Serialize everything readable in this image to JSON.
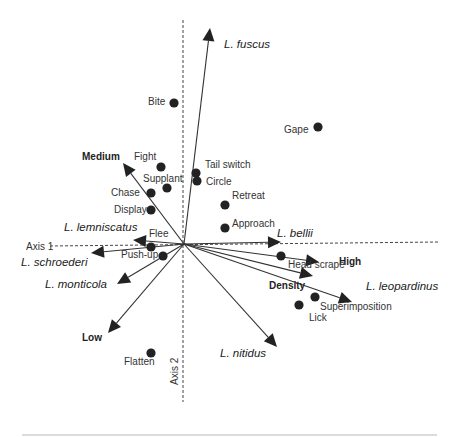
{
  "figure": {
    "type": "biplot",
    "origin": [
      184,
      244
    ],
    "axes": {
      "axis1": {
        "label": "Axis 1",
        "x1": 50,
        "y1": 246,
        "x2": 440,
        "y2": 242,
        "label_pos": [
          26,
          250
        ]
      },
      "axis2": {
        "label": "Axis 2",
        "x1": 183,
        "y1": 20,
        "x2": 183,
        "y2": 402,
        "label_pos": [
          178,
          385
        ]
      }
    },
    "species_vectors": [
      {
        "label": "L. fuscus",
        "tip": [
          210,
          28
        ],
        "label_pos": [
          224,
          48
        ]
      },
      {
        "label": "L. bellii",
        "tip": [
          281,
          242
        ],
        "label_pos": [
          277,
          237
        ]
      },
      {
        "label": "L. leopardinus",
        "tip": [
          352,
          302
        ],
        "label_pos": [
          366,
          290
        ]
      },
      {
        "label": "L. lemniscatus",
        "tip": [
          133,
          240
        ],
        "label_pos": [
          64,
          231
        ]
      },
      {
        "label": "L. schroederi",
        "tip": [
          91,
          253
        ],
        "label_pos": [
          21,
          266
        ]
      },
      {
        "label": "L. monticola",
        "tip": [
          117,
          284
        ],
        "label_pos": [
          45,
          288
        ]
      },
      {
        "label": "L. nitidus",
        "tip": [
          277,
          347
        ],
        "label_pos": [
          220,
          357
        ]
      }
    ],
    "factor_vectors": [
      {
        "label": "Medium",
        "tip": [
          123,
          163
        ],
        "label_pos": [
          82,
          160
        ]
      },
      {
        "label": "High",
        "tip": [
          319,
          262
        ],
        "label_pos": [
          339,
          265
        ]
      },
      {
        "label": "Density",
        "tip": [
          313,
          276
        ],
        "label_pos": [
          269,
          289
        ]
      },
      {
        "label": "Low",
        "tip": [
          108,
          333
        ],
        "label_pos": [
          82,
          341
        ]
      }
    ],
    "behaviors": [
      {
        "label": "Bite",
        "pt": [
          174,
          103
        ],
        "label_pos": [
          148,
          105
        ],
        "anchor": "start"
      },
      {
        "label": "Gape",
        "pt": [
          318,
          127
        ],
        "label_pos": [
          284,
          133
        ],
        "anchor": "start"
      },
      {
        "label": "Fight",
        "pt": [
          161,
          167
        ],
        "label_pos": [
          134,
          160
        ],
        "anchor": "start"
      },
      {
        "label": "Tail switch",
        "pt": [
          196,
          173
        ],
        "label_pos": [
          205,
          168
        ],
        "anchor": "start"
      },
      {
        "label": "Circle",
        "pt": [
          197,
          181
        ],
        "label_pos": [
          206,
          185
        ],
        "anchor": "start"
      },
      {
        "label": "Supplant",
        "pt": [
          167,
          188
        ],
        "label_pos": [
          143,
          182
        ],
        "anchor": "start"
      },
      {
        "label": "Chase",
        "pt": [
          151,
          193
        ],
        "label_pos": [
          111,
          196
        ],
        "anchor": "start"
      },
      {
        "label": "Retreat",
        "pt": [
          225,
          205
        ],
        "label_pos": [
          232,
          199
        ],
        "anchor": "start"
      },
      {
        "label": "Display",
        "pt": [
          151,
          210
        ],
        "label_pos": [
          114,
          213
        ],
        "anchor": "start"
      },
      {
        "label": "Approach",
        "pt": [
          225,
          228
        ],
        "label_pos": [
          232,
          227
        ],
        "anchor": "start"
      },
      {
        "label": "Flee",
        "pt": [
          151,
          247
        ],
        "label_pos": [
          149,
          237
        ],
        "anchor": "start"
      },
      {
        "label": "Push-up",
        "pt": [
          163,
          256
        ],
        "label_pos": [
          121,
          258
        ],
        "anchor": "start"
      },
      {
        "label": "Head scrape",
        "pt": [
          281,
          256
        ],
        "label_pos": [
          288,
          268
        ],
        "anchor": "start"
      },
      {
        "label": "Superimposition",
        "pt": [
          315,
          297
        ],
        "label_pos": [
          320,
          310
        ],
        "anchor": "start"
      },
      {
        "label": "Lick",
        "pt": [
          299,
          305
        ],
        "label_pos": [
          309,
          321
        ],
        "anchor": "start"
      },
      {
        "label": "Flatten",
        "pt": [
          151,
          353
        ],
        "label_pos": [
          124,
          365
        ],
        "anchor": "start"
      }
    ]
  }
}
